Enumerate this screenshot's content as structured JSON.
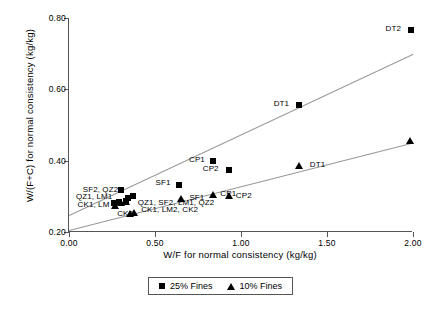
{
  "chart_data": {
    "type": "scatter",
    "title": "",
    "xlabel": "W/F for normal consistency (kg/kg)",
    "ylabel": "W/(F+C) for normal consistency (kg/kg)",
    "xlim": [
      0.0,
      2.0
    ],
    "ylim": [
      0.2,
      0.8
    ],
    "xticks": [
      "0.00",
      "0.50",
      "1.00",
      "1.50",
      "2.00"
    ],
    "xtick_values": [
      0.0,
      0.5,
      1.0,
      1.5,
      2.0
    ],
    "yticks": [
      "0.20",
      "0.40",
      "0.60",
      "0.80"
    ],
    "ytick_values": [
      0.2,
      0.4,
      0.6,
      0.8
    ],
    "grid": false,
    "legend_position": "bottom-center",
    "series": [
      {
        "name": "25% Fines",
        "marker": "square",
        "points": [
          {
            "x": 0.26,
            "y": 0.282
          },
          {
            "x": 0.29,
            "y": 0.285
          },
          {
            "x": 0.3,
            "y": 0.318
          },
          {
            "x": 0.33,
            "y": 0.288
          },
          {
            "x": 0.345,
            "y": 0.295
          },
          {
            "x": 0.37,
            "y": 0.3
          },
          {
            "x": 0.64,
            "y": 0.333
          },
          {
            "x": 0.84,
            "y": 0.398
          },
          {
            "x": 0.93,
            "y": 0.375
          },
          {
            "x": 1.34,
            "y": 0.555
          },
          {
            "x": 1.99,
            "y": 0.765
          }
        ]
      },
      {
        "name": "10% Fines",
        "marker": "triangle",
        "points": [
          {
            "x": 0.27,
            "y": 0.272
          },
          {
            "x": 0.3,
            "y": 0.28
          },
          {
            "x": 0.33,
            "y": 0.283
          },
          {
            "x": 0.355,
            "y": 0.25
          },
          {
            "x": 0.375,
            "y": 0.252
          },
          {
            "x": 0.65,
            "y": 0.292
          },
          {
            "x": 0.84,
            "y": 0.305
          },
          {
            "x": 0.93,
            "y": 0.3
          },
          {
            "x": 1.34,
            "y": 0.385
          },
          {
            "x": 1.98,
            "y": 0.455
          }
        ]
      }
    ],
    "trendlines": [
      {
        "name": "25% Fines trend",
        "x0": 0.0,
        "y0": 0.248,
        "x1": 2.0,
        "y1": 0.7
      },
      {
        "name": "10% Fines trend",
        "x0": 0.0,
        "y0": 0.205,
        "x1": 2.0,
        "y1": 0.45
      }
    ],
    "annotations": [
      {
        "name": "dt2-square-label",
        "text": "DT2",
        "x": 1.93,
        "y": 0.768,
        "align": "right"
      },
      {
        "name": "dt1-square-label",
        "text": "DT1",
        "x": 1.28,
        "y": 0.558,
        "align": "right"
      },
      {
        "name": "cp1-square-label",
        "text": "CP1",
        "x": 0.79,
        "y": 0.401,
        "align": "right"
      },
      {
        "name": "cp2-square-label",
        "text": "CP2",
        "x": 0.87,
        "y": 0.378,
        "align": "right"
      },
      {
        "name": "sf1-square-label",
        "text": "SF1",
        "x": 0.59,
        "y": 0.336,
        "align": "right"
      },
      {
        "name": "dt1-triangle-label",
        "text": "DT1",
        "x": 1.4,
        "y": 0.387,
        "align": "left"
      },
      {
        "name": "cp1-triangle-label",
        "text": "CP1",
        "x": 0.88,
        "y": 0.307,
        "align": "left"
      },
      {
        "name": "cp2-triangle-label",
        "text": "CP2",
        "x": 0.97,
        "y": 0.3,
        "align": "left"
      },
      {
        "name": "sf1-triangle-label",
        "text": "SF1",
        "x": 0.7,
        "y": 0.296,
        "align": "left"
      },
      {
        "name": "cluster-square-label-1",
        "text": "SF2, QZ2",
        "x": 0.08,
        "y": 0.318,
        "align": "left"
      },
      {
        "name": "cluster-square-label-2",
        "text": "QZ1, LM1",
        "x": 0.04,
        "y": 0.298,
        "align": "left"
      },
      {
        "name": "cluster-square-label-3",
        "text": "CK1, LM",
        "x": 0.05,
        "y": 0.277,
        "align": "left"
      },
      {
        "name": "cluster-triangle-label-1",
        "text": "QZ1, SF2, LM1, QZ2",
        "x": 0.4,
        "y": 0.282,
        "align": "left"
      },
      {
        "name": "cluster-triangle-label-2",
        "text": "CK1, LM2, CK2",
        "x": 0.42,
        "y": 0.262,
        "align": "left"
      },
      {
        "name": "ck2-triangle-label",
        "text": "CK2",
        "x": 0.28,
        "y": 0.251,
        "align": "left"
      }
    ]
  },
  "legend": {
    "items": [
      {
        "label": "25% Fines",
        "marker": "square"
      },
      {
        "label": "10% Fines",
        "marker": "triangle"
      }
    ]
  }
}
